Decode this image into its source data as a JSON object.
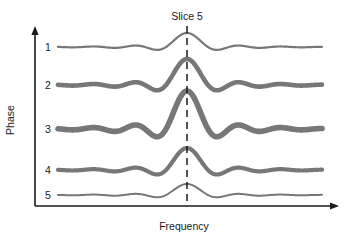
{
  "figure": {
    "slice_marker": {
      "label": "Slice 5",
      "x": 187,
      "line_top": 26,
      "line_bottom": 206,
      "style": "dashed"
    },
    "axes": {
      "y_title": "Phase",
      "x_title": "Frequency",
      "y_axis_x": 35,
      "y_axis_top": 32,
      "y_axis_bottom": 206,
      "x_axis_y": 206,
      "x_axis_left": 35,
      "x_axis_right": 333,
      "tick_labels": [
        "1",
        "2",
        "3",
        "4",
        "5"
      ]
    },
    "colors": {
      "wave": "#77777a",
      "axis": "#1a1a1a",
      "text": "#1a1a1a",
      "background": "#ffffff"
    }
  },
  "chart_data": {
    "type": "line",
    "title": "",
    "subtitle": "",
    "xlabel": "Frequency",
    "ylabel": "Phase",
    "annotations": [
      {
        "text": "Slice 5",
        "x": 187,
        "y": 17,
        "marker": "dashed-vertical-line"
      }
    ],
    "legend": [],
    "grid": false,
    "xlim": [
      35,
      333
    ],
    "ylim": [
      206,
      32
    ],
    "series": [
      {
        "name": "1",
        "phase_index": 1,
        "baseline_y": 47,
        "amplitude": 9,
        "stroke_width": 2.2,
        "peak_height": 14,
        "center_x": 187,
        "values": [
          0,
          0.04,
          -0.06,
          0.12,
          -0.18,
          0.34,
          -0.5,
          1.0,
          -0.5,
          0.34,
          -0.18,
          0.12,
          -0.06,
          0.04,
          0
        ]
      },
      {
        "name": "2",
        "phase_index": 2,
        "baseline_y": 85,
        "amplitude": 17,
        "stroke_width": 4.6,
        "peak_height": 26,
        "center_x": 187,
        "values": [
          0,
          0.06,
          -0.1,
          0.2,
          -0.3,
          0.5,
          -0.62,
          1.0,
          -0.62,
          0.5,
          -0.3,
          0.2,
          -0.1,
          0.06,
          0
        ]
      },
      {
        "name": "3",
        "phase_index": 3,
        "baseline_y": 129,
        "amplitude": 24,
        "stroke_width": 5.6,
        "peak_height": 38,
        "center_x": 187,
        "values": [
          0,
          0.08,
          -0.14,
          0.26,
          -0.38,
          0.62,
          -0.72,
          1.0,
          -0.72,
          0.62,
          -0.38,
          0.26,
          -0.14,
          0.08,
          0
        ]
      },
      {
        "name": "4",
        "phase_index": 4,
        "baseline_y": 170,
        "amplitude": 14,
        "stroke_width": 4.2,
        "peak_height": 22,
        "center_x": 187,
        "values": [
          0,
          0.06,
          -0.1,
          0.2,
          -0.3,
          0.5,
          -0.6,
          1.0,
          -0.6,
          0.5,
          -0.3,
          0.2,
          -0.1,
          0.06,
          0
        ]
      },
      {
        "name": "5",
        "phase_index": 5,
        "baseline_y": 195,
        "amplitude": 7,
        "stroke_width": 2.0,
        "peak_height": 11,
        "center_x": 187,
        "values": [
          0,
          0.04,
          -0.06,
          0.12,
          -0.18,
          0.34,
          -0.5,
          1.0,
          -0.5,
          0.34,
          -0.18,
          0.12,
          -0.06,
          0.04,
          0
        ]
      }
    ],
    "tick_positions_y": [
      47,
      85,
      129,
      170,
      195
    ]
  }
}
